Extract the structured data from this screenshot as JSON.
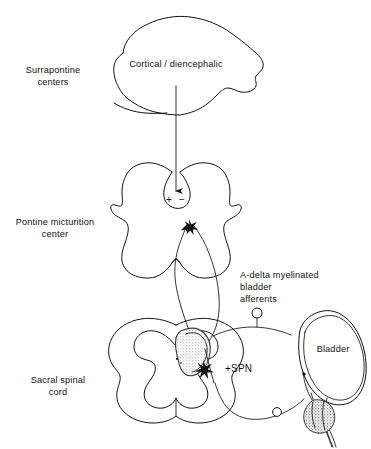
{
  "figure": {
    "type": "anatomical-diagram",
    "background_color": "#ffffff",
    "line_color": "#111111",
    "shading_color": "#9a9a9a"
  },
  "side_labels": {
    "suprapontine": {
      "line1": "Surrapontine",
      "line2": "centers"
    },
    "pontine": {
      "line1": "Pontine micturition",
      "line2": "center"
    },
    "sacral": {
      "line1": "Sacral spinal",
      "line2": "cord"
    }
  },
  "structures": {
    "brain_label": "Cortical / diencephalic",
    "bladder_label": "Bladder",
    "spn_label": "+SPN",
    "afferents_label": {
      "line1": "A-delta myelinated",
      "line2": "bladder",
      "line3": "afferents"
    }
  },
  "symbols": {
    "excitatory": "+",
    "inhibitory": "−"
  }
}
